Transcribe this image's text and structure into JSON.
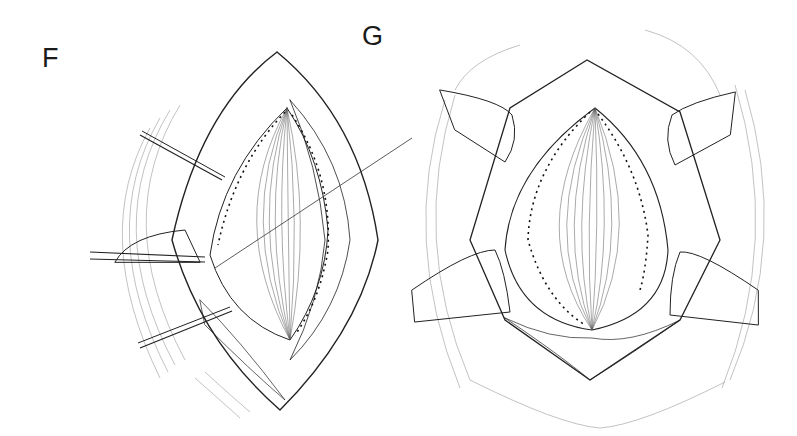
{
  "figure": {
    "type": "surgical line illustration",
    "panels": [
      {
        "label": "F",
        "description": "Surgical incision opened with three retractor instruments from left; muscle fascia exposed with running suture line along edges and a suture thread crossing diagonally"
      },
      {
        "label": "G",
        "description": "Wound edges retracted on four sides by retractor blades; central muscle layer with dashed suture line along left and right margins"
      }
    ],
    "colors": {
      "background": "#ffffff",
      "ink": "#222222"
    }
  }
}
